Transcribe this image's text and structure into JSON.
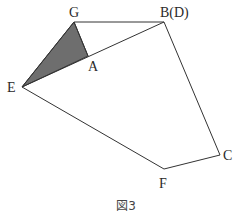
{
  "figure": {
    "caption": "図3",
    "shaded_region": {
      "vertices": [
        "G",
        "E",
        "A"
      ],
      "fill": "#6e6e6e"
    },
    "points": {
      "G": {
        "label": "G",
        "x": 74,
        "y": 22
      },
      "B": {
        "label": "B(D)",
        "x": 164,
        "y": 22
      },
      "A": {
        "label": "A",
        "x": 88,
        "y": 56
      },
      "E": {
        "label": "E",
        "x": 22,
        "y": 87
      },
      "C": {
        "label": "C",
        "x": 220,
        "y": 155
      },
      "F": {
        "label": "F",
        "x": 164,
        "y": 169
      }
    },
    "segments": [
      [
        "G",
        "B"
      ],
      [
        "E",
        "B"
      ],
      [
        "G",
        "E"
      ],
      [
        "G",
        "A"
      ],
      [
        "B",
        "C"
      ],
      [
        "C",
        "F"
      ],
      [
        "F",
        "E"
      ]
    ]
  }
}
